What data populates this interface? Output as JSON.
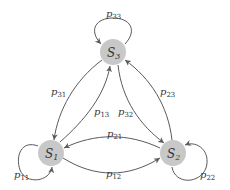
{
  "diagram": {
    "type": "markov-chain-state-diagram",
    "colors": {
      "node_fill": "#c8c8c8",
      "edge": "#5a5a5a",
      "text": "#333333"
    },
    "nodes": [
      {
        "id": "S1",
        "base": "S",
        "sub": "1"
      },
      {
        "id": "S2",
        "base": "S",
        "sub": "2"
      },
      {
        "id": "S3",
        "base": "S",
        "sub": "3"
      }
    ],
    "edges": [
      {
        "from": "S1",
        "to": "S1",
        "base": "p",
        "sub": "11"
      },
      {
        "from": "S2",
        "to": "S2",
        "base": "p",
        "sub": "22"
      },
      {
        "from": "S3",
        "to": "S3",
        "base": "p",
        "sub": "33"
      },
      {
        "from": "S1",
        "to": "S2",
        "base": "p",
        "sub": "12"
      },
      {
        "from": "S2",
        "to": "S1",
        "base": "p",
        "sub": "21"
      },
      {
        "from": "S1",
        "to": "S3",
        "base": "p",
        "sub": "13"
      },
      {
        "from": "S3",
        "to": "S1",
        "base": "p",
        "sub": "31"
      },
      {
        "from": "S2",
        "to": "S3",
        "base": "p",
        "sub": "23"
      },
      {
        "from": "S3",
        "to": "S2",
        "base": "p",
        "sub": "32"
      }
    ]
  }
}
